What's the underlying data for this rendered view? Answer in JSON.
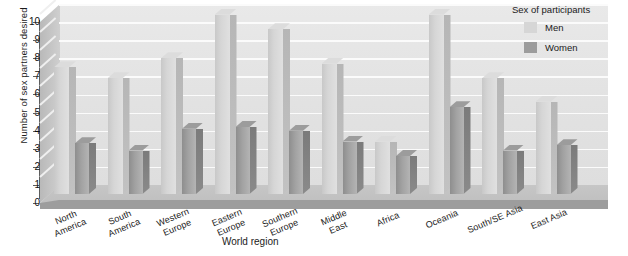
{
  "chart_data": {
    "type": "bar",
    "title": "",
    "xlabel": "World region",
    "ylabel": "Number of sex partners desired",
    "ylim": [
      0,
      10
    ],
    "yticks": [
      0,
      1,
      2,
      3,
      4,
      5,
      6,
      7,
      8,
      9,
      10
    ],
    "grid": true,
    "legend_title": "Sex of participants",
    "legend_position": "top-right",
    "categories": [
      "North\nAmerica",
      "South\nAmerica",
      "Western\nEurope",
      "Eastern\nEurope",
      "Southern\nEurope",
      "Middle\nEast",
      "Africa",
      "Oceania",
      "South/SE Asia",
      "East Asia"
    ],
    "series": [
      {
        "name": "Men",
        "color": "#d6d6d6",
        "values": [
          7.0,
          6.4,
          7.5,
          9.9,
          9.1,
          7.2,
          2.9,
          9.9,
          6.4,
          5.1
        ]
      },
      {
        "name": "Women",
        "color": "#9c9c9c",
        "values": [
          2.8,
          2.4,
          3.6,
          3.7,
          3.5,
          2.9,
          2.1,
          4.8,
          2.4,
          2.7
        ]
      }
    ]
  },
  "colors": {
    "men": "#d6d6d6",
    "women": "#9c9c9c",
    "back_wall": "#e4e4e4",
    "floor": "#c0c0c0",
    "gridline": "#fbfbfb",
    "axis": "#5d5d5d"
  }
}
